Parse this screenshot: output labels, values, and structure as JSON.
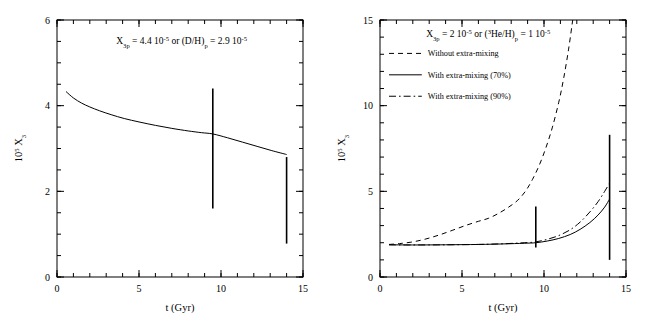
{
  "figure": {
    "background": "#ffffff",
    "foreground": "#000000"
  },
  "chart_data": [
    {
      "type": "line",
      "panel": "left",
      "title": "",
      "xlabel": "t (Gyr)",
      "ylabel": "10⁵ X₃",
      "ylabel_mantissa": "10",
      "ylabel_exponent": "5",
      "ylabel_symbol": " X",
      "ylabel_symbol_sub": "3",
      "xlim": [
        0,
        15
      ],
      "ylim": [
        0,
        6
      ],
      "xticks": [
        0,
        5,
        10,
        15
      ],
      "xticklabels": [
        "0",
        "5",
        "10",
        "15"
      ],
      "yticks": [
        0,
        2,
        4,
        6
      ],
      "yticklabels": [
        "0",
        "2",
        "4",
        "6"
      ],
      "xminor_step": 1,
      "yminor_step": 0.5,
      "grid": false,
      "legend_position": "none",
      "annotation": {
        "parts": [
          {
            "text": "X",
            "style": "normal"
          },
          {
            "text": "3p",
            "style": "sub"
          },
          {
            "text": " = 4.4 10",
            "style": "normal"
          },
          {
            "text": "-5",
            "style": "sup"
          },
          {
            "text": " or (D/H)",
            "style": "normal"
          },
          {
            "text": "p",
            "style": "sub"
          },
          {
            "text": " = 2.9 10",
            "style": "normal"
          },
          {
            "text": "-5",
            "style": "sup"
          }
        ],
        "plain": "X_3p = 4.4 10^-5 or (D/H)_p = 2.9 10^-5",
        "x_data": 7.6,
        "y_data": 5.45
      },
      "series": [
        {
          "name": "3He abundance",
          "style": "solid",
          "x": [
            0.55,
            1.0,
            1.5,
            2.0,
            2.6,
            3.3,
            4.1,
            5.0,
            6.0,
            7.0,
            8.0,
            8.8,
            9.5,
            10.4,
            11.3,
            12.2,
            13.1,
            14.0
          ],
          "y": [
            4.33,
            4.18,
            4.06,
            3.97,
            3.88,
            3.79,
            3.7,
            3.62,
            3.54,
            3.47,
            3.41,
            3.37,
            3.34,
            3.25,
            3.15,
            3.05,
            2.95,
            2.86
          ]
        }
      ],
      "errorbars": [
        {
          "x": 9.5,
          "ylow": 1.6,
          "yhigh": 4.4,
          "label": "protosolar"
        },
        {
          "x": 14.0,
          "ylow": 0.78,
          "yhigh": 2.8,
          "label": "HII regions"
        }
      ]
    },
    {
      "type": "line",
      "panel": "right",
      "title": "",
      "xlabel": "t (Gyr)",
      "ylabel": "10⁵ X₃",
      "ylabel_mantissa": "10",
      "ylabel_exponent": "5",
      "ylabel_symbol": " X",
      "ylabel_symbol_sub": "3",
      "xlim": [
        0,
        15
      ],
      "ylim": [
        0,
        15
      ],
      "xticks": [
        0,
        5,
        10,
        15
      ],
      "xticklabels": [
        "0",
        "5",
        "10",
        "15"
      ],
      "yticks": [
        0,
        5,
        10,
        15
      ],
      "yticklabels": [
        "0",
        "5",
        "10",
        "15"
      ],
      "xminor_step": 1,
      "yminor_step": 1,
      "grid": false,
      "legend_position": "upper-left",
      "annotation": {
        "parts": [
          {
            "text": "X",
            "style": "normal"
          },
          {
            "text": "3p",
            "style": "sub"
          },
          {
            "text": " = 2 10",
            "style": "normal"
          },
          {
            "text": "-5",
            "style": "sup"
          },
          {
            "text": " or (",
            "style": "normal"
          },
          {
            "text": "3",
            "style": "sup"
          },
          {
            "text": "He/H)",
            "style": "normal"
          },
          {
            "text": "p",
            "style": "sub"
          },
          {
            "text": " = 1 10",
            "style": "normal"
          },
          {
            "text": "-5",
            "style": "sup"
          }
        ],
        "plain": "X_3p = 2 10^-5 or (3He/H)_p = 1 10^-5",
        "x_data": 6.6,
        "y_data": 14.0
      },
      "legend": [
        {
          "label": "Without extra-mixing",
          "style": "dashed"
        },
        {
          "label": "With extra-mixing (70%)",
          "style": "solid"
        },
        {
          "label": "With extra-mixing (90%)",
          "style": "dashdot"
        }
      ],
      "series": [
        {
          "name": "Without extra-mixing",
          "style": "dashed",
          "x": [
            0.55,
            1.2,
            2.0,
            2.8,
            3.6,
            4.4,
            5.2,
            6.0,
            6.6,
            7.2,
            7.8,
            8.4,
            8.9,
            9.3,
            9.7,
            10.1,
            10.5,
            10.9,
            11.2,
            11.5,
            11.75
          ],
          "y": [
            1.9,
            1.95,
            2.05,
            2.22,
            2.45,
            2.72,
            3.0,
            3.25,
            3.42,
            3.7,
            4.05,
            4.48,
            5.05,
            5.7,
            6.5,
            7.5,
            8.7,
            10.2,
            11.6,
            13.3,
            15.0
          ]
        },
        {
          "name": "With extra-mixing (70%)",
          "style": "solid",
          "x": [
            0.55,
            2.0,
            4.0,
            6.0,
            7.5,
            8.8,
            9.5,
            10.2,
            10.9,
            11.6,
            12.2,
            12.8,
            13.3,
            13.7,
            14.0
          ],
          "y": [
            1.88,
            1.87,
            1.88,
            1.9,
            1.93,
            1.97,
            2.0,
            2.1,
            2.25,
            2.48,
            2.78,
            3.18,
            3.62,
            4.08,
            4.55
          ]
        },
        {
          "name": "With extra-mixing (90%)",
          "style": "dashdot",
          "x": [
            0.55,
            2.0,
            4.0,
            6.0,
            7.5,
            8.8,
            9.5,
            10.2,
            10.9,
            11.6,
            12.2,
            12.8,
            13.3,
            13.7,
            14.0
          ],
          "y": [
            1.88,
            1.87,
            1.88,
            1.9,
            1.94,
            2.0,
            2.05,
            2.2,
            2.42,
            2.76,
            3.2,
            3.8,
            4.4,
            5.0,
            5.48
          ]
        }
      ],
      "errorbars": [
        {
          "x": 9.5,
          "ylow": 1.72,
          "yhigh": 4.12,
          "label": "protosolar"
        },
        {
          "x": 14.0,
          "ylow": 1.0,
          "yhigh": 8.3,
          "label": "HII regions"
        }
      ]
    }
  ]
}
